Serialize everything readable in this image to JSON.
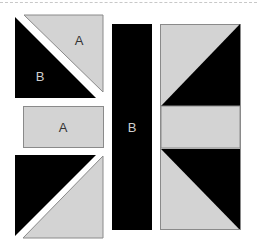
{
  "diagram": {
    "type": "quilt-block-piecing-diagram",
    "colors": {
      "light_fabric": "#d3d3d3",
      "dark_fabric": "#000000",
      "outline": "#8a8a8a",
      "label_on_light": "#333333",
      "label_on_dark": "#cfcfcf",
      "background": "#ffffff"
    },
    "pieces": {
      "top_left_hst": {
        "light_label": "A",
        "dark_label": "B"
      },
      "middle_left_rect": {
        "label": "A"
      },
      "center_strip": {
        "label": "B"
      }
    }
  }
}
